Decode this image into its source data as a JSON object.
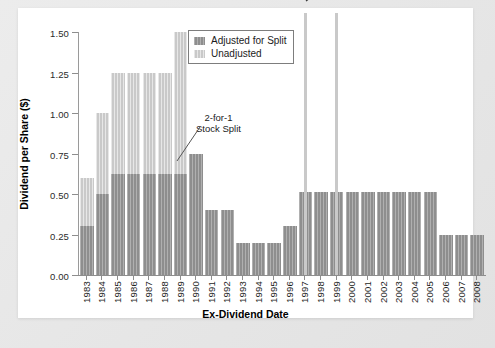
{
  "chart_data": {
    "type": "bar",
    "title": "",
    "xlabel": "Ex-Dividend Date",
    "ylabel": "Dividend per Share ($)",
    "ylim": [
      0.0,
      1.5
    ],
    "yticks": [
      "0.00",
      "0.25",
      "0.50",
      "0.75",
      "1.00",
      "1.25",
      "1.50"
    ],
    "ytick_values": [
      0.0,
      0.25,
      0.5,
      0.75,
      1.0,
      1.25,
      1.5
    ],
    "grid": false,
    "legend_position": "top-center",
    "categories": [
      "1983",
      "1984",
      "1985",
      "1986",
      "1987",
      "1988",
      "1989",
      "1990",
      "1991",
      "1992",
      "1993",
      "1994",
      "1995",
      "1996",
      "1997",
      "1998",
      "1999",
      "2000",
      "2001",
      "2002",
      "2003",
      "2004",
      "2005",
      "2006",
      "2007",
      "2008"
    ],
    "series": [
      {
        "name": "Unadjusted",
        "color": "#c9c9c9",
        "values": [
          0.6,
          1.0,
          1.25,
          1.25,
          1.25,
          1.25,
          1.5,
          null,
          null,
          null,
          null,
          null,
          null,
          null,
          null,
          null,
          null,
          null,
          null,
          null,
          null,
          null,
          null,
          null,
          null,
          null
        ]
      },
      {
        "name": "Adjusted for Split",
        "color": "#8e8e8e",
        "values": [
          0.3,
          0.5,
          0.625,
          0.625,
          0.625,
          0.625,
          0.625,
          0.75,
          0.4,
          0.4,
          0.2,
          0.2,
          0.2,
          0.3,
          0.51,
          0.51,
          0.51,
          0.51,
          0.51,
          0.51,
          0.51,
          0.51,
          0.51,
          0.25,
          0.25,
          0.25
        ]
      }
    ],
    "truncated_bars": [
      {
        "category": "1997",
        "label": "$3.27",
        "value": 3.27
      },
      {
        "category": "1999",
        "label": "$13.72",
        "value": 13.72
      }
    ],
    "annotations": [
      {
        "name": "stock-split",
        "text_line1": "2-for-1",
        "text_line2": "Stock Split",
        "points_to": "1990"
      }
    ]
  },
  "legend": {
    "items": [
      {
        "label": "Adjusted for Split",
        "swatch": "dark-gray"
      },
      {
        "label": "Unadjusted",
        "swatch": "light-gray"
      }
    ]
  },
  "axes": {
    "y_title": "Dividend per Share ($)",
    "x_title": "Ex-Dividend Date"
  },
  "colors": {
    "adjusted": "#8e8e8e",
    "unadjusted": "#c9c9c9",
    "axis": "#8e8e8e",
    "plate": "#ffffff",
    "page_background": "#e9e9e9"
  }
}
